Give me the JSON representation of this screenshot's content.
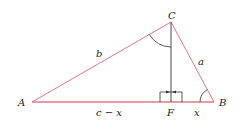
{
  "diagram": {
    "vertices": {
      "A": {
        "label": "A",
        "x": 32,
        "y": 102
      },
      "B": {
        "label": "B",
        "x": 214,
        "y": 102
      },
      "C": {
        "label": "C",
        "x": 171,
        "y": 22
      },
      "F": {
        "label": "F",
        "x": 171,
        "y": 102
      }
    },
    "side_labels": {
      "b": "b",
      "a": "a",
      "c_minus_x": "c − x",
      "x": "x"
    },
    "colors": {
      "triangle_sides": "#e0788a",
      "altitude": "#333333",
      "arcs": "#333333"
    }
  }
}
